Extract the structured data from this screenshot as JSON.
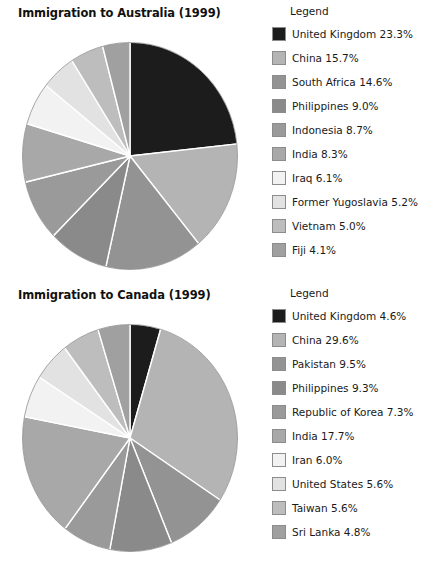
{
  "palette": {
    "slice_colors": [
      "#1c1c1c",
      "#b4b4b4",
      "#939393",
      "#8a8a8a",
      "#9a9a9a",
      "#a8a8a8",
      "#f2f2f2",
      "#e2e2e2",
      "#bdbdbd",
      "#a0a0a0"
    ],
    "separator": "#ffffff",
    "swatch_border": "#8c8c8c",
    "text": "#1a1a1a"
  },
  "charts": [
    {
      "id": "australia",
      "title": "Immigration to Australia (1999)",
      "legend_title": "Legend",
      "legend_rows": [
        {
          "label": "United Kingdom 23.3%",
          "color": "#1c1c1c"
        },
        {
          "label": "China 15.7%",
          "color": "#b4b4b4"
        },
        {
          "label": "South Africa 14.6%",
          "color": "#939393"
        },
        {
          "label": "Philippines 9.0%",
          "color": "#8a8a8a"
        },
        {
          "label": "Indonesia 8.7%",
          "color": "#9a9a9a"
        },
        {
          "label": "India 8.3%",
          "color": "#a8a8a8"
        },
        {
          "label": "Iraq 6.1%",
          "color": "#f2f2f2"
        },
        {
          "label": "Former Yugoslavia 5.2%",
          "color": "#e2e2e2"
        },
        {
          "label": "Vietnam 5.0%",
          "color": "#bdbdbd"
        },
        {
          "label": "Fiji 4.1%",
          "color": "#a0a0a0"
        }
      ]
    },
    {
      "id": "canada",
      "title": "Immigration to Canada (1999)",
      "legend_title": "Legend",
      "legend_rows": [
        {
          "label": "United Kingdom 4.6%",
          "color": "#1c1c1c"
        },
        {
          "label": "China 29.6%",
          "color": "#b4b4b4"
        },
        {
          "label": "Pakistan 9.5%",
          "color": "#939393"
        },
        {
          "label": "Philippines 9.3%",
          "color": "#8a8a8a"
        },
        {
          "label": "Republic of Korea 7.3%",
          "color": "#9a9a9a"
        },
        {
          "label": "India 17.7%",
          "color": "#a8a8a8"
        },
        {
          "label": "Iran 6.0%",
          "color": "#f2f2f2"
        },
        {
          "label": "United States 5.6%",
          "color": "#e2e2e2"
        },
        {
          "label": "Taiwan 5.6%",
          "color": "#bdbdbd"
        },
        {
          "label": "Sri Lanka 4.8%",
          "color": "#a0a0a0"
        }
      ]
    }
  ],
  "chart_data": [
    {
      "type": "pie",
      "title": "Immigration to Australia (1999)",
      "legend_title": "Legend",
      "legend_position": "right",
      "start_angle_deg": 0,
      "direction": "clockwise",
      "unit": "percent",
      "categories": [
        "United Kingdom",
        "China",
        "South Africa",
        "Philippines",
        "Indonesia",
        "India",
        "Iraq",
        "Former Yugoslavia",
        "Vietnam",
        "Fiji"
      ],
      "values": [
        23.3,
        15.7,
        14.6,
        9.0,
        8.7,
        8.3,
        6.1,
        5.2,
        5.0,
        4.1
      ],
      "labels": [
        "United Kingdom 23.3%",
        "China 15.7%",
        "South Africa 14.6%",
        "Philippines 9.0%",
        "Indonesia 8.7%",
        "India 8.3%",
        "Iraq 6.1%",
        "Former Yugoslavia 5.2%",
        "Vietnam 5.0%",
        "Fiji 4.1%"
      ],
      "colors": [
        "#1c1c1c",
        "#b4b4b4",
        "#939393",
        "#8a8a8a",
        "#9a9a9a",
        "#a8a8a8",
        "#f2f2f2",
        "#e2e2e2",
        "#bdbdbd",
        "#a0a0a0"
      ],
      "total_shown": 100.0
    },
    {
      "type": "pie",
      "title": "Immigration to Canada (1999)",
      "legend_title": "Legend",
      "legend_position": "right",
      "start_angle_deg": 0,
      "direction": "clockwise",
      "unit": "percent",
      "categories": [
        "United Kingdom",
        "China",
        "Pakistan",
        "Philippines",
        "Republic of Korea",
        "India",
        "Iran",
        "United States",
        "Taiwan",
        "Sri Lanka"
      ],
      "values": [
        4.6,
        29.6,
        9.5,
        9.3,
        7.3,
        17.7,
        6.0,
        5.6,
        5.6,
        4.8
      ],
      "labels": [
        "United Kingdom 4.6%",
        "China 29.6%",
        "Pakistan 9.5%",
        "Philippines 9.3%",
        "Republic of Korea 7.3%",
        "India 17.7%",
        "Iran 6.0%",
        "United States 5.6%",
        "Taiwan 5.6%",
        "Sri Lanka 4.8%"
      ],
      "colors": [
        "#1c1c1c",
        "#b4b4b4",
        "#939393",
        "#8a8a8a",
        "#9a9a9a",
        "#a8a8a8",
        "#f2f2f2",
        "#e2e2e2",
        "#bdbdbd",
        "#a0a0a0"
      ],
      "total_shown": 100.0
    }
  ]
}
